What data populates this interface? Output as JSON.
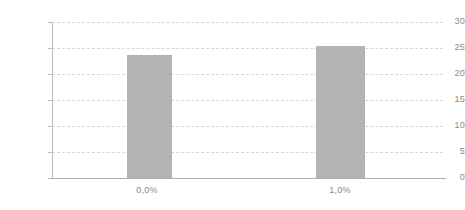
{
  "chart_data": {
    "type": "bar",
    "title": "",
    "subtitle": "",
    "xlabel": "",
    "ylabel": "",
    "categories": [
      "0,0%",
      "1,0%"
    ],
    "values": [
      23.7,
      25.4
    ],
    "series": [
      {
        "name": "",
        "values": [
          23.7,
          25.4
        ]
      }
    ],
    "ylim": [
      0,
      30
    ],
    "yticks": [
      0,
      5,
      10,
      15,
      20,
      25,
      30
    ],
    "ytick_labels": [
      "0",
      "5",
      "10",
      "15",
      "20",
      "25",
      "30"
    ],
    "grid": "horizontal-dashed",
    "legend": "none",
    "annotations": []
  },
  "style": {
    "bar_color": "#b3b3b3",
    "gridline_color": "#d8d8d8",
    "axis_color": "#b0b0b0",
    "tick_label_color": "#8a8a8a",
    "background_color": "#ffffff"
  }
}
